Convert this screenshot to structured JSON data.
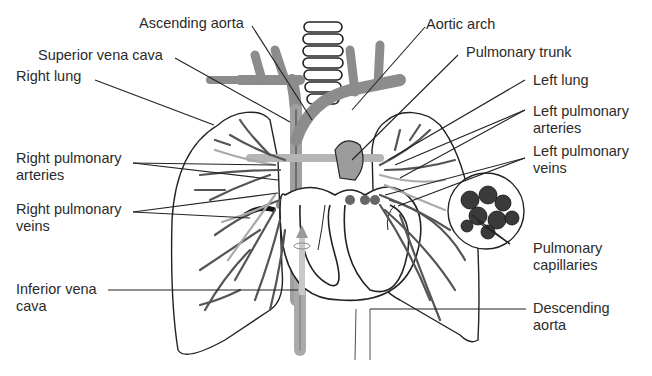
{
  "diagram": {
    "colors": {
      "outline": "#222222",
      "vessel_gray": "#8c8c8c",
      "vessel_light": "#b5b5b5",
      "vessel_dark": "#4a4a4a",
      "text": "#2b2b2b",
      "background": "#ffffff"
    },
    "labels": {
      "ascending_aorta": "Ascending aorta",
      "aortic_arch": "Aortic arch",
      "superior_vena_cava": "Superior vena cava",
      "pulmonary_trunk": "Pulmonary trunk",
      "right_lung": "Right lung",
      "left_lung": "Left lung",
      "left_pulmonary_arteries": [
        "Left pulmonary",
        "arteries"
      ],
      "right_pulmonary_arteries": [
        "Right pulmonary",
        "arteries"
      ],
      "left_pulmonary_veins": [
        "Left pulmonary",
        "veins"
      ],
      "right_pulmonary_veins": [
        "Right pulmonary",
        "veins"
      ],
      "inferior_vena_cava": [
        "Inferior vena",
        "cava"
      ],
      "pulmonary_capillaries": [
        "Pulmonary",
        "capillaries"
      ],
      "descending_aorta": [
        "Descending",
        "aorta"
      ]
    }
  }
}
